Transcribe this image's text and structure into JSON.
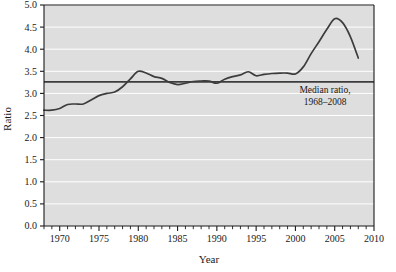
{
  "chart_data": {
    "type": "line",
    "title": "",
    "xlabel": "Year",
    "ylabel": "Ratio",
    "xlim": [
      1968,
      2010
    ],
    "ylim": [
      0.0,
      5.0
    ],
    "grid": true,
    "grid_orientation": "horizontal",
    "legend": "none",
    "plot_background_color": "#dedede",
    "grid_color": "#ffffff",
    "line_color": "#3c3c3c",
    "axis_color": "#1a1a1a",
    "x_major_ticks": [
      1970,
      1975,
      1980,
      1985,
      1990,
      1995,
      2000,
      2005,
      2010
    ],
    "x_major_tick_labels": [
      "1970",
      "1975",
      "1980",
      "1985",
      "1990",
      "1995",
      "2000",
      "2005",
      "2010"
    ],
    "x_minor_tick_interval": 1,
    "y_ticks": [
      0.0,
      0.5,
      1.0,
      1.5,
      2.0,
      2.5,
      3.0,
      3.5,
      4.0,
      4.5,
      5.0
    ],
    "y_tick_labels": [
      "0.0",
      "0.5",
      "1.0",
      "1.5",
      "2.0",
      "2.5",
      "3.0",
      "3.5",
      "4.0",
      "4.5",
      "5.0"
    ],
    "series": [
      {
        "name": "Ratio",
        "x": [
          1968,
          1969,
          1970,
          1971,
          1972,
          1973,
          1974,
          1975,
          1976,
          1977,
          1978,
          1979,
          1980,
          1981,
          1982,
          1983,
          1984,
          1985,
          1986,
          1987,
          1988,
          1989,
          1990,
          1991,
          1992,
          1993,
          1994,
          1995,
          1996,
          1997,
          1998,
          1999,
          2000,
          2001,
          2002,
          2003,
          2004,
          2005,
          2006,
          2007,
          2008
        ],
        "values": [
          2.62,
          2.62,
          2.66,
          2.75,
          2.76,
          2.76,
          2.85,
          2.95,
          3.0,
          3.03,
          3.15,
          3.33,
          3.5,
          3.46,
          3.38,
          3.34,
          3.25,
          3.2,
          3.23,
          3.27,
          3.28,
          3.28,
          3.23,
          3.32,
          3.38,
          3.42,
          3.49,
          3.4,
          3.43,
          3.45,
          3.46,
          3.46,
          3.44,
          3.6,
          3.9,
          4.17,
          4.45,
          4.69,
          4.6,
          4.28,
          3.8
        ]
      }
    ],
    "reference_line": {
      "label_line1": "Median ratio,",
      "label_line2": "1968–2008",
      "value": 3.26,
      "x_start": 1968,
      "x_end": 2010,
      "color": "#3c3c3c"
    }
  }
}
